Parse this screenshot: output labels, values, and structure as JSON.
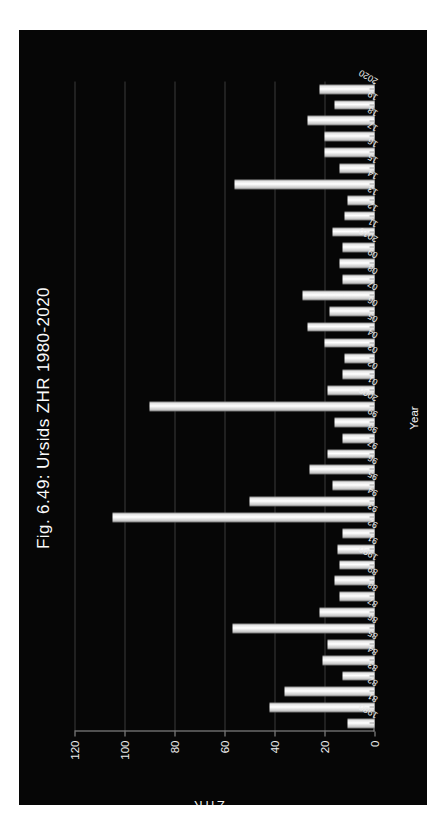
{
  "figure": {
    "title": "Fig. 6.49: Ursids ZHR 1980-2020",
    "background_color": "#060606",
    "bar_color": "#ffffff",
    "grid_color": "#3a3a3a",
    "axis_color": "#9a9a9a",
    "text_color": "#f2f2f2"
  },
  "chart_data": {
    "type": "bar",
    "title": "Fig. 6.49: Ursids ZHR 1980-2020",
    "xlabel": "Year",
    "ylabel": "ZHR",
    "ylim": [
      0,
      120
    ],
    "yticks": [
      0,
      20,
      40,
      60,
      80,
      100,
      120
    ],
    "grid": true,
    "legend": false,
    "orientation": "vertical-bars-rotated-page",
    "categories": [
      "1980",
      "81",
      "82",
      "83",
      "84",
      "85",
      "86",
      "87",
      "88",
      "89",
      "1990",
      "91",
      "92",
      "93",
      "94",
      "95",
      "96",
      "97",
      "98",
      "99",
      "2000",
      "01",
      "02",
      "03",
      "04",
      "05",
      "06",
      "07",
      "08",
      "09",
      "2010",
      "11",
      "12",
      "13",
      "14",
      "15",
      "16",
      "17",
      "18",
      "19",
      "2020"
    ],
    "tick_labels": [
      "1980",
      "81",
      "82",
      "83",
      "84",
      "85",
      "86",
      "87",
      "88",
      "89",
      "1990",
      "91",
      "92",
      "93",
      "94",
      "95",
      "96",
      "97",
      "98",
      "99",
      "2000",
      "01",
      "02",
      "03",
      "04",
      "05",
      "06",
      "07",
      "08",
      "09",
      "2010",
      "11",
      "12",
      "13",
      "14",
      "15",
      "16",
      "17",
      "18",
      "19",
      "2020"
    ],
    "values": [
      11,
      42,
      36,
      13,
      21,
      19,
      57,
      22,
      14,
      16,
      14,
      15,
      13,
      105,
      50,
      17,
      26,
      19,
      13,
      16,
      90,
      19,
      13,
      12,
      20,
      27,
      18,
      29,
      13,
      14,
      13,
      17,
      12,
      11,
      56,
      14,
      20,
      20,
      27,
      16,
      22
    ],
    "series": [
      {
        "name": "Ursids ZHR",
        "values": [
          11,
          42,
          36,
          13,
          21,
          19,
          57,
          22,
          14,
          16,
          14,
          15,
          13,
          105,
          50,
          17,
          26,
          19,
          13,
          16,
          90,
          19,
          13,
          12,
          20,
          27,
          18,
          29,
          13,
          14,
          13,
          17,
          12,
          11,
          56,
          14,
          20,
          20,
          27,
          16,
          22
        ]
      }
    ]
  }
}
